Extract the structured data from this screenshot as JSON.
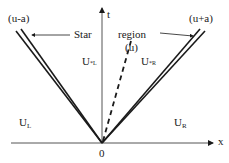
{
  "diagram": {
    "type": "riemann-fan",
    "axes": {
      "t_label": "t",
      "x_label": "x",
      "origin_label": "0"
    },
    "waves": {
      "left": "(u-a)",
      "right": "(u+a)",
      "contact_line": "(u)"
    },
    "star_region": {
      "word1": "Star",
      "word2": "region",
      "contact": "(u)"
    },
    "states": {
      "left": {
        "base": "U",
        "sub": "L"
      },
      "star_left": {
        "base": "U",
        "sub": "*L"
      },
      "star_right": {
        "base": "U",
        "sub": "*R"
      },
      "right": {
        "base": "U",
        "sub": "R"
      }
    },
    "colors": {
      "ink": "#1a1a1a",
      "background": "#ffffff",
      "axis": "#555555"
    }
  }
}
